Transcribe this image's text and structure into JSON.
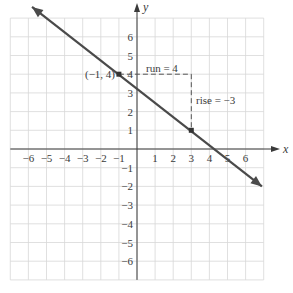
{
  "chart_data": {
    "type": "line",
    "title": "",
    "xlabel": "x",
    "ylabel": "y",
    "xlim": [
      -7,
      7
    ],
    "ylim": [
      -7,
      7
    ],
    "grid": true,
    "x_ticks": [
      -6,
      -5,
      -4,
      -3,
      -2,
      -1,
      1,
      2,
      3,
      4,
      5,
      6
    ],
    "y_ticks": [
      6,
      5,
      4,
      3,
      2,
      1,
      -1,
      -2,
      -3,
      -4,
      -5,
      -6
    ],
    "x_tick_labels": [
      "−6",
      "−5",
      "−4",
      "−3",
      "−2",
      "−1",
      "1",
      "2",
      "3",
      "4",
      "5",
      "6"
    ],
    "y_tick_labels": [
      "6",
      "5",
      "4",
      "3",
      "2",
      "1",
      "−1",
      "−2",
      "−3",
      "−4",
      "−5",
      "−6"
    ],
    "series": [
      {
        "name": "line",
        "equation": "y = -3/4 x + 13/4",
        "slope": -0.75,
        "y_intercept": 3.25,
        "x": [
          -5.8,
          6.9
        ],
        "y": [
          7.6,
          -2.0
        ],
        "arrows_both_ends": true,
        "color": "#4a4a4a"
      }
    ],
    "points": [
      {
        "x": -1,
        "y": 4,
        "label": "(−1, 4)"
      },
      {
        "x": 3,
        "y": 1,
        "label": ""
      }
    ],
    "annotations": [
      {
        "text": "run = 4",
        "type": "dashed-horizontal",
        "from": [
          -1,
          4
        ],
        "to": [
          3,
          4
        ]
      },
      {
        "text": "rise = −3",
        "type": "dashed-vertical",
        "from": [
          3,
          4
        ],
        "to": [
          3,
          1
        ]
      }
    ],
    "colors": {
      "grid": "#d8d8d8",
      "axis": "#3a3a3a",
      "line": "#4a4a4a",
      "dashed": "#555555"
    }
  },
  "labels": {
    "x_axis": "x",
    "y_axis": "y",
    "point_a": "(−1, 4)",
    "run": "run = 4",
    "rise": "rise = −3"
  }
}
